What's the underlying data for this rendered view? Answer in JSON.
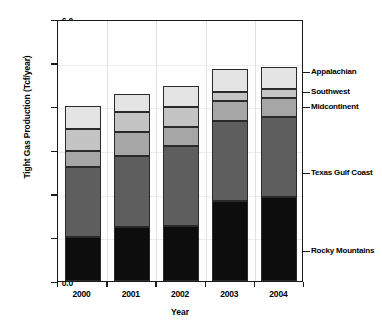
{
  "chart_data": {
    "type": "bar",
    "subtype": "stacked-bar",
    "title": "",
    "xlabel": "Year",
    "ylabel": "Tight Gas Production (Tcf/year)",
    "categories": [
      "2000",
      "2001",
      "2002",
      "2003",
      "2004"
    ],
    "ylim": [
      0.0,
      6.0
    ],
    "yticks": [
      "0.0",
      "1.0",
      "2.0",
      "3.0",
      "4.0",
      "5.0",
      "6.0"
    ],
    "ytick_values": [
      0.0,
      1.0,
      2.0,
      3.0,
      4.0,
      5.0,
      6.0
    ],
    "grid": "light vertical gridlines at category boundaries",
    "legend_position": "right, inline annotations",
    "series": [
      {
        "name": "Rocky Mountains",
        "color": "#0d0d0d",
        "values": [
          1.0,
          1.24,
          1.27,
          1.84,
          1.92
        ]
      },
      {
        "name": "Texas Gulf Coast",
        "color": "#5e5e5e",
        "values": [
          1.6,
          1.62,
          1.83,
          1.83,
          1.83
        ]
      },
      {
        "name": "Midcontinent",
        "color": "#a6a6a6",
        "values": [
          0.37,
          0.56,
          0.42,
          0.46,
          0.43
        ]
      },
      {
        "name": "Southwest",
        "color": "#c4c4c4",
        "values": [
          0.5,
          0.45,
          0.46,
          0.19,
          0.22
        ]
      },
      {
        "name": "Appalachian",
        "color": "#e4e4e4",
        "values": [
          0.53,
          0.41,
          0.49,
          0.53,
          0.5
        ]
      }
    ],
    "totals": [
      4.0,
      4.28,
      4.47,
      4.85,
      4.9
    ]
  },
  "legend": {
    "appalachian": "Appalachian",
    "southwest": "Southwest",
    "midcontinent": "Midcontinent",
    "texas_gulf_coast": "Texas Gulf Coast",
    "rocky_mountains": "Rocky Mountains"
  }
}
